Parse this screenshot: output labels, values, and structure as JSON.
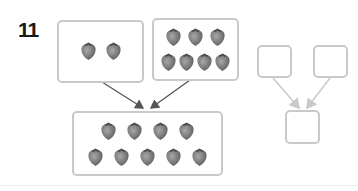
{
  "problem": {
    "number": "11",
    "item_icon": "strawberry-icon",
    "colors": {
      "box_border": "#c9c9c9",
      "arrow": "#555555",
      "arrow_empty": "#c9c9c9",
      "berry": "#7a7a7a"
    },
    "part_left": {
      "count": 2,
      "rows": [
        2
      ]
    },
    "part_right": {
      "count": 7,
      "rows": [
        3,
        4
      ]
    },
    "whole": {
      "count": 9,
      "rows": [
        4,
        5
      ]
    },
    "answer_boxes": {
      "part_left": "",
      "part_right": "",
      "whole": ""
    }
  }
}
